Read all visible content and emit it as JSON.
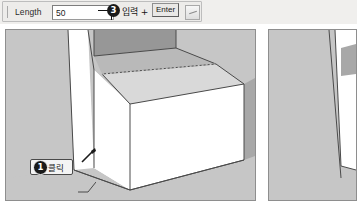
{
  "toolbar": {
    "length_label": "Length",
    "length_value": "50",
    "length_placeholder": "",
    "grip_icon": "drag-grip-icon",
    "spinner_icon": "resize-grip-icon",
    "step3": {
      "number": "3",
      "text": "입력 +",
      "key_label": "Enter"
    }
  },
  "panels": {
    "left": {
      "label": "viewport-left",
      "callout": {
        "number": "1",
        "text": "클릭"
      },
      "cursor_icon": "pencil-cursor-icon"
    },
    "right": {
      "label": "viewport-right"
    }
  },
  "colors": {
    "viewport_background": "#c6c6c6",
    "face_front": "#ffffff",
    "face_top": "#d8d8d8",
    "face_side": "#a9a9a9",
    "face_interior": "#949494",
    "ground": "#c0c0c0",
    "edge": "#4a4a4a",
    "badge": "#1a1a1a",
    "toolbar_background": "#f0efed"
  }
}
